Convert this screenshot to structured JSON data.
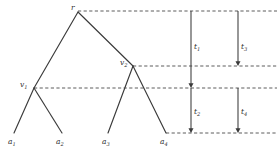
{
  "figure": {
    "background_color": "#ffffff",
    "line_color": "#3a3a3a",
    "dashed_color": "#4a4a4a",
    "label_color": "#2f2f2f",
    "width": 280,
    "height": 155
  },
  "nodes": [
    {
      "id": "root",
      "label": "r",
      "sub": "",
      "x": 78,
      "y": 12,
      "label_x": 71,
      "label_y": 4
    },
    {
      "id": "v1",
      "label": "v",
      "sub": "1",
      "x": 34,
      "y": 88,
      "label_x": 20,
      "label_y": 81
    },
    {
      "id": "v2",
      "label": "v",
      "sub": "2",
      "x": 133,
      "y": 66,
      "label_x": 120,
      "label_y": 59
    }
  ],
  "leaves": [
    {
      "id": "a1",
      "label": "a",
      "sub": "1",
      "x": 14,
      "y": 133,
      "label_x": 8,
      "label_y": 138
    },
    {
      "id": "a2",
      "label": "a",
      "sub": "2",
      "x": 62,
      "y": 133,
      "label_x": 56,
      "label_y": 138
    },
    {
      "id": "a3",
      "label": "a",
      "sub": "3",
      "x": 108,
      "y": 133,
      "label_x": 102,
      "label_y": 138
    },
    {
      "id": "a4",
      "label": "a",
      "sub": "4",
      "x": 166,
      "y": 133,
      "label_x": 160,
      "label_y": 138
    }
  ],
  "edges": [
    {
      "from": "root",
      "to": "v1",
      "x1": 78,
      "y1": 12,
      "x2": 34,
      "y2": 88
    },
    {
      "from": "root",
      "to": "v2",
      "x1": 78,
      "y1": 12,
      "x2": 133,
      "y2": 66
    },
    {
      "from": "v1",
      "to": "a1",
      "x1": 34,
      "y1": 88,
      "x2": 14,
      "y2": 133
    },
    {
      "from": "v1",
      "to": "a2",
      "x1": 34,
      "y1": 88,
      "x2": 62,
      "y2": 133
    },
    {
      "from": "v2",
      "to": "a3",
      "x1": 133,
      "y1": 66,
      "x2": 108,
      "y2": 133
    },
    {
      "from": "v2",
      "to": "a4",
      "x1": 133,
      "y1": 66,
      "x2": 166,
      "y2": 133
    }
  ],
  "dashed_lines": [
    {
      "id": "root-level",
      "y": 11,
      "x1": 78,
      "x2": 277
    },
    {
      "id": "v2-level",
      "y": 66,
      "x1": 133,
      "x2": 277
    },
    {
      "id": "v1-level",
      "y": 88,
      "x1": 34,
      "x2": 277
    },
    {
      "id": "leaf-level",
      "y": 133,
      "x1": 166,
      "x2": 277
    }
  ],
  "time_arrows": [
    {
      "id": "t1",
      "label": "t",
      "sub": "1",
      "x": 191,
      "y1": 11,
      "y2": 88,
      "label_x": 194,
      "label_y": 43
    },
    {
      "id": "t3",
      "label": "t",
      "sub": "3",
      "x": 238,
      "y1": 11,
      "y2": 66,
      "label_x": 241,
      "label_y": 43
    },
    {
      "id": "t2",
      "label": "t",
      "sub": "2",
      "x": 191,
      "y1": 88,
      "y2": 133,
      "label_x": 194,
      "label_y": 108
    },
    {
      "id": "t4",
      "label": "t",
      "sub": "4",
      "x": 238,
      "y1": 88,
      "y2": 133,
      "label_x": 241,
      "label_y": 108
    }
  ]
}
